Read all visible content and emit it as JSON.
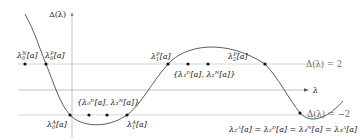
{
  "diagram": {
    "type": "discriminant-curve",
    "y_axis_label": "Δ(λ)",
    "x_axis_label": "λ",
    "reference_lines": [
      {
        "id": "upper",
        "label": "Δ(λ) = 2",
        "value": 2
      },
      {
        "id": "axis",
        "label": "λ",
        "value": 0
      },
      {
        "id": "lower",
        "label": "Δ(λ) = −2",
        "value": -2
      }
    ],
    "points": [
      {
        "id": "lambda0N",
        "label": "λ₀ᴺ[a]",
        "base": "λ",
        "sub": "0",
        "sup": "N",
        "tail": "[a]"
      },
      {
        "id": "lambda0P",
        "label": "λ₀ᴾ[a]",
        "base": "λ",
        "sub": "0",
        "sup": "P",
        "tail": "[a]"
      },
      {
        "id": "lambda1P",
        "label": "λ₁ᴾ[a]",
        "base": "λ",
        "sub": "1",
        "sup": "P",
        "tail": "[a]"
      },
      {
        "id": "lambda2P",
        "label": "λ₂ᴾ[a]",
        "base": "λ",
        "sub": "2",
        "sup": "P",
        "tail": "[a]"
      },
      {
        "id": "lambda0A",
        "label": "λ₀ᴬ[a]",
        "base": "λ",
        "sub": "0",
        "sup": "A",
        "tail": "[a]"
      },
      {
        "id": "lambda1A",
        "label": "λ₁ᴬ[a]",
        "base": "λ",
        "sub": "1",
        "sup": "A",
        "tail": "[a]"
      }
    ],
    "set_labels": {
      "lower_set": "{λ₀ᴰ[a], λ₁ᴺ[a]}",
      "upper_set": "{λ₁ᴰ[a], λ₂ᴺ[a]}"
    },
    "equality_label": "λ₂ᴬ[a] = λ₂ᴰ[a] = λ₃ᴺ[a] = λ₃ᴬ[a]",
    "colors": {
      "curve": "#333333",
      "reference_line": "#bbbbbb",
      "axis": "#999999",
      "point": "#111111",
      "level_text": "#666666"
    }
  }
}
